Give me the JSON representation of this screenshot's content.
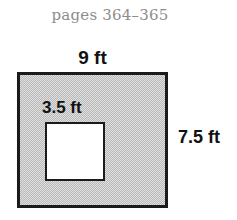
{
  "figure": {
    "page_reference": "pages 364–365",
    "outer_rect": {
      "top_label": "9 ft",
      "right_label": "7.5 ft",
      "fill_color": "#b9b9b9",
      "border_color": "#1b1b1b"
    },
    "inner_square": {
      "label": "3.5 ft",
      "fill_color": "#ffffff",
      "border_color": "#1b1b1b"
    },
    "background_color": "#ffffff",
    "caption_color": "#8d8d8d"
  }
}
